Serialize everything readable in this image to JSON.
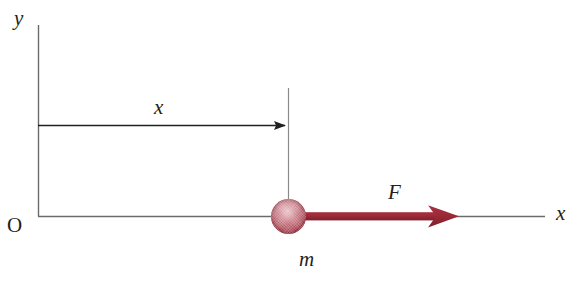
{
  "diagram": {
    "canvas": {
      "width": 588,
      "height": 282,
      "background": "#ffffff"
    },
    "colors": {
      "axis": "#6b6b6b",
      "measure_arrow": "#231f20",
      "force_arrow": "#9c2a37",
      "force_arrow_dark": "#7f1f2b",
      "ball_edge": "#7c1b28",
      "ball_center": "#e3b3b9",
      "label_text": "#231f20"
    },
    "labels": {
      "y_axis": "y",
      "x_axis": "x",
      "origin": "O",
      "displacement": "x",
      "mass": "m",
      "force": "F"
    },
    "geometry": {
      "origin": {
        "x": 38,
        "y": 216
      },
      "y_axis_top": {
        "x": 38,
        "y": 25
      },
      "x_axis_end": {
        "x": 545,
        "y": 216
      },
      "measure_arrow": {
        "x1": 38,
        "y1": 125,
        "x2": 288,
        "y2": 125
      },
      "drop_line": {
        "x1": 288,
        "y1": 88,
        "x2": 288,
        "y2": 205
      },
      "ball": {
        "cx": 288.5,
        "cy": 216.5,
        "r": 17.5
      },
      "force_arrow": {
        "x1": 303,
        "y1": 216,
        "x2": 458,
        "y2": 216
      }
    }
  }
}
